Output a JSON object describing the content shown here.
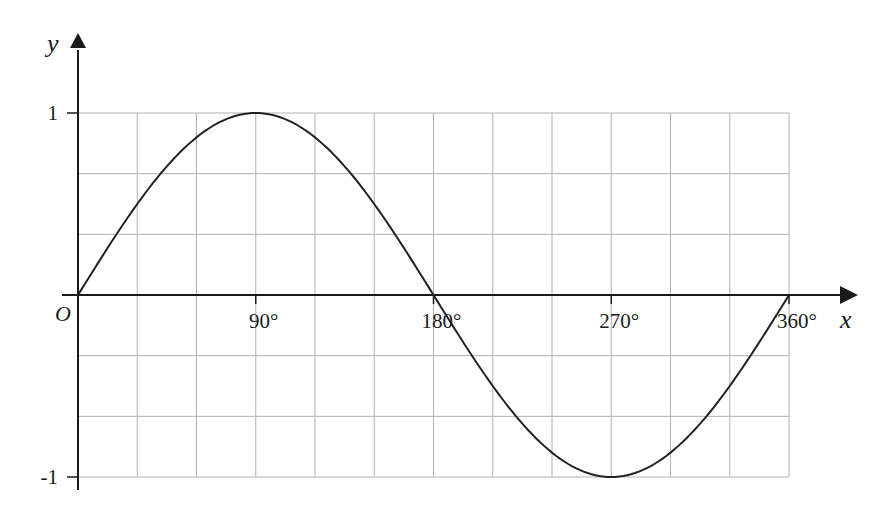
{
  "chart_data": {
    "type": "line",
    "title": "",
    "function": "y = sin x",
    "xlabel": "x",
    "ylabel": "y",
    "origin_label": "O",
    "xlim": [
      0,
      360
    ],
    "ylim": [
      -1,
      1
    ],
    "x_ticks": [
      {
        "value": 90,
        "label": "90°"
      },
      {
        "value": 180,
        "label": "180°"
      },
      {
        "value": 270,
        "label": "270°"
      },
      {
        "value": 360,
        "label": "360°"
      }
    ],
    "y_ticks": [
      {
        "value": 1,
        "label": "1"
      },
      {
        "value": -1,
        "label": "-1"
      }
    ],
    "grid": {
      "on": true,
      "x_step": 30,
      "y_step": 0.3333
    },
    "series": [
      {
        "name": "sin x",
        "x": [
          0,
          30,
          60,
          90,
          120,
          150,
          180,
          210,
          240,
          270,
          300,
          330,
          360
        ],
        "values": [
          0,
          0.5,
          0.866,
          1,
          0.866,
          0.5,
          0,
          -0.5,
          -0.866,
          -1,
          -0.866,
          -0.5,
          0
        ]
      }
    ],
    "legend": null
  },
  "colors": {
    "grid": "#b0b0b0",
    "axis": "#1a1a1a",
    "curve": "#222222",
    "background": "#ffffff"
  }
}
